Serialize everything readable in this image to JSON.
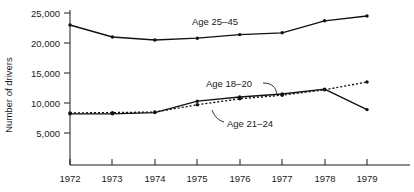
{
  "chart_data": {
    "type": "line",
    "title": "",
    "xlabel": "",
    "ylabel": "Number of drivers",
    "x": [
      1972,
      1973,
      1974,
      1975,
      1976,
      1977,
      1978,
      1979
    ],
    "xtick_labels": [
      "1972",
      "1973",
      "1974",
      "1975",
      "1976",
      "1977",
      "1978",
      "1979"
    ],
    "ytick_values": [
      5000,
      10000,
      15000,
      20000,
      25000
    ],
    "ytick_labels": [
      "5,000",
      "10,000",
      "15,000",
      "20,000",
      "25,000"
    ],
    "ylim": [
      0,
      26500
    ],
    "xlim": [
      1971.6,
      1979.6
    ],
    "grid": false,
    "legend": "inline-annotations",
    "series": [
      {
        "name": "Age 25-45",
        "label": "Age 25–45",
        "style": "solid",
        "marker": "dot",
        "values": [
          23000,
          21000,
          20500,
          20800,
          21400,
          21700,
          23700,
          24500
        ]
      },
      {
        "name": "Age 18-20",
        "label": "Age 18–20",
        "style": "solid",
        "marker": "dot",
        "values": [
          8200,
          8200,
          8400,
          10300,
          11000,
          11500,
          12300,
          8900
        ]
      },
      {
        "name": "Age 21-24",
        "label": "Age 21–24",
        "style": "dotted",
        "marker": "dot",
        "values": [
          8350,
          8400,
          8500,
          9700,
          10700,
          11300,
          12200,
          13500
        ]
      }
    ],
    "annotations": [
      {
        "text": "Age 25–45",
        "series": "Age 25-45",
        "leader": false
      },
      {
        "text": "Age 18–20",
        "series": "Age 18-20",
        "leader": true
      },
      {
        "text": "Age 21–24",
        "series": "Age 21-24",
        "leader": true
      }
    ],
    "colors": {
      "axis": "#1a1a1a",
      "series_line": "#111111",
      "background": "#ffffff"
    }
  }
}
